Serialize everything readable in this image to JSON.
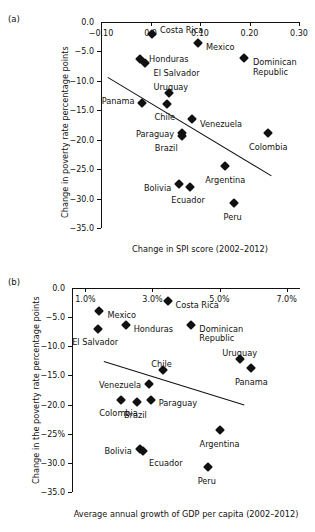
{
  "figure": {
    "top_cropped_text": "",
    "panels": [
      {
        "tag": "(a)",
        "xlabel": "Change in SPI score (2002–2012)",
        "ylabel": "Change in poverty rate percentage points",
        "xticks": [
          "−0.10",
          "0.0",
          "0.10",
          "0.20",
          "0.30"
        ],
        "yticks": [
          "−5.0",
          "−10.0",
          "−15.0",
          "−20.0",
          "−25.0",
          "−30.0",
          "−35.0"
        ]
      },
      {
        "tag": "(b)",
        "xlabel": "Average annual growth of GDP per capita (2002–2012)",
        "ylabel": "Change in the poverty rate percentage points",
        "xticks": [
          "1.0%",
          "3.0%",
          "5.0%",
          "7.0%"
        ],
        "yticks": [
          "0.0",
          "−5.0",
          "−10.0",
          "−15.0",
          "−20.0",
          "−25%",
          "−30.0",
          "−35.0"
        ]
      }
    ]
  },
  "chart_data": [
    {
      "type": "scatter",
      "panel": "(a)",
      "title": "",
      "xlabel": "Change in SPI score (2002–2012)",
      "ylabel": "Change in poverty rate percentage points",
      "xlim": [
        -0.1,
        0.3
      ],
      "ylim": [
        -35.0,
        0.0
      ],
      "xticks": [
        -0.1,
        0.0,
        0.1,
        0.2,
        0.3
      ],
      "yticks": [
        0.0,
        -5.0,
        -10.0,
        -15.0,
        -20.0,
        -25.0,
        -30.0,
        -35.0
      ],
      "grid": false,
      "legend": "none",
      "trendline": {
        "x0": -0.085,
        "y0": -9.3,
        "x1": 0.245,
        "y1": -26.0
      },
      "points": [
        {
          "label": "Costa Rica",
          "x": 0.003,
          "y": -2.1
        },
        {
          "label": "Mexico",
          "x": 0.096,
          "y": -3.5
        },
        {
          "label": "Honduras",
          "x": -0.021,
          "y": -6.3
        },
        {
          "label": "El Salvador",
          "x": -0.012,
          "y": -6.9
        },
        {
          "label": "Dominican Republic",
          "x": 0.189,
          "y": -6.2
        },
        {
          "label": "Uruguay",
          "x": 0.037,
          "y": -12.1
        },
        {
          "label": "Panama",
          "x": -0.018,
          "y": -13.7
        },
        {
          "label": "Chile",
          "x": 0.033,
          "y": -13.9
        },
        {
          "label": "Venezuela",
          "x": 0.084,
          "y": -16.5
        },
        {
          "label": "Paraguay",
          "x": 0.064,
          "y": -18.8
        },
        {
          "label": "Brazil",
          "x": 0.063,
          "y": -19.3
        },
        {
          "label": "Colombia",
          "x": 0.238,
          "y": -18.9
        },
        {
          "label": "Argentina",
          "x": 0.151,
          "y": -24.4
        },
        {
          "label": "Bolivia",
          "x": 0.058,
          "y": -27.6
        },
        {
          "label": "Ecuador",
          "x": 0.08,
          "y": -28.1
        },
        {
          "label": "Peru",
          "x": 0.168,
          "y": -30.7
        }
      ]
    },
    {
      "type": "scatter",
      "panel": "(b)",
      "title": "",
      "xlabel": "Average annual growth of GDP per capita (2002–2012)",
      "ylabel": "Change in the poverty rate percentage points",
      "xlim": [
        0.6,
        7.4
      ],
      "ylim": [
        -35.0,
        0.0
      ],
      "xticks": [
        1.0,
        3.0,
        5.0,
        7.0
      ],
      "yticks": [
        0.0,
        -5.0,
        -10.0,
        -15.0,
        -20.0,
        -25.0,
        -30.0,
        -35.0
      ],
      "grid": false,
      "legend": "none",
      "trendline": {
        "x0": 1.55,
        "y0": -12.6,
        "x1": 5.75,
        "y1": -20.1
      },
      "points": [
        {
          "label": "Costa Rica",
          "x": 3.45,
          "y": -2.3
        },
        {
          "label": "Mexico",
          "x": 1.42,
          "y": -4.0
        },
        {
          "label": "Honduras",
          "x": 2.2,
          "y": -6.3
        },
        {
          "label": "El Salvador",
          "x": 1.38,
          "y": -7.0
        },
        {
          "label": "Dominican Republic",
          "x": 4.16,
          "y": -6.3
        },
        {
          "label": "Uruguay",
          "x": 5.6,
          "y": -12.2
        },
        {
          "label": "Panama",
          "x": 5.95,
          "y": -13.7
        },
        {
          "label": "Chile",
          "x": 3.3,
          "y": -14.1
        },
        {
          "label": "Venezuela",
          "x": 2.9,
          "y": -16.5
        },
        {
          "label": "Paraguay",
          "x": 2.95,
          "y": -19.2
        },
        {
          "label": "Brazil",
          "x": 2.55,
          "y": -19.6
        },
        {
          "label": "Colombia",
          "x": 2.05,
          "y": -19.2
        },
        {
          "label": "Argentina",
          "x": 5.0,
          "y": -24.4
        },
        {
          "label": "Bolivia",
          "x": 2.62,
          "y": -27.6
        },
        {
          "label": "Ecuador",
          "x": 2.72,
          "y": -28.0
        },
        {
          "label": "Peru",
          "x": 4.65,
          "y": -30.7
        }
      ]
    }
  ]
}
